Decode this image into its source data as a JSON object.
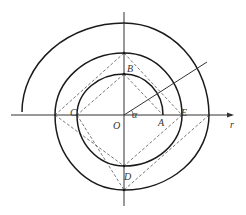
{
  "diagram": {
    "type": "archimedean-spiral-construction",
    "colors": {
      "stroke": "#1a1a1a",
      "axis": "#333333",
      "dashed": "#555555",
      "background": "#ffffff"
    },
    "origin": {
      "label": "O",
      "x": 124,
      "y": 115
    },
    "axes": {
      "horizontal": {
        "x1": 11,
        "x2": 232,
        "y": 115,
        "label": "r",
        "arrow": true
      },
      "vertical": {
        "x": 124,
        "y1": 12,
        "y2": 206
      }
    },
    "angle_label": "α",
    "ray": {
      "x1": 124,
      "y1": 115,
      "x2": 207,
      "y2": 62
    },
    "points": [
      {
        "label": "A",
        "x": 163,
        "y": 115,
        "lx": 158,
        "ly": 126
      },
      {
        "label": "B",
        "x": 124,
        "y": 74,
        "lx": 127,
        "ly": 72
      },
      {
        "label": "C",
        "x": 77,
        "y": 115,
        "lx": 70,
        "ly": 115
      },
      {
        "label": "D",
        "x": 124,
        "y": 166,
        "lx": 124,
        "ly": 179
      },
      {
        "label": "E",
        "x": 182,
        "y": 115,
        "lx": 181,
        "ly": 115
      }
    ],
    "spiral_points": [
      [
        163,
        115
      ],
      [
        124,
        74
      ],
      [
        77,
        115
      ],
      [
        124,
        166
      ],
      [
        182,
        115
      ],
      [
        124,
        53
      ],
      [
        55,
        115
      ],
      [
        124,
        190
      ],
      [
        209,
        115
      ],
      [
        124,
        23
      ],
      [
        22,
        112
      ]
    ],
    "dashed_segments": [
      [
        [
          124,
          53
        ],
        [
          55,
          115
        ]
      ],
      [
        [
          124,
          53
        ],
        [
          182,
          115
        ]
      ],
      [
        [
          124,
          74
        ],
        [
          77,
          115
        ]
      ],
      [
        [
          124,
          74
        ],
        [
          163,
          115
        ]
      ],
      [
        [
          55,
          115
        ],
        [
          124,
          166
        ]
      ],
      [
        [
          77,
          115
        ],
        [
          124,
          190
        ]
      ],
      [
        [
          182,
          115
        ],
        [
          124,
          166
        ]
      ],
      [
        [
          209,
          115
        ],
        [
          124,
          190
        ]
      ]
    ]
  }
}
